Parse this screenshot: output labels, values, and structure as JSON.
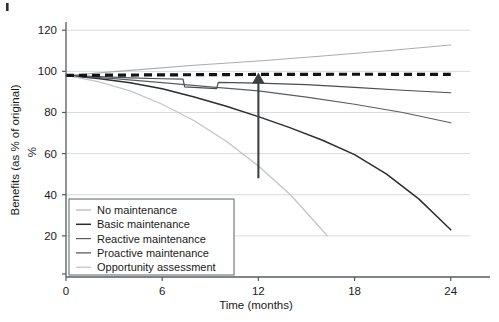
{
  "chart_data": {
    "type": "line",
    "title": "",
    "xlabel": "Time (months)",
    "ylabel": "Benefits (as % of original)",
    "ylabel_unit": "%",
    "xlim": [
      0,
      25.2
    ],
    "ylim": [
      0,
      124
    ],
    "x_ticks": [
      0,
      6,
      12,
      18,
      24
    ],
    "x_tick_labels": [
      "0",
      "6",
      "12",
      "18",
      "24"
    ],
    "y_ticks": [
      20,
      40,
      60,
      80,
      100,
      120
    ],
    "y_tick_labels": [
      "20",
      "40",
      "60",
      "80",
      "100",
      "120"
    ],
    "grid": "horizontal",
    "legend_position": "lower-left-inside",
    "series": [
      {
        "name": "No maintenance",
        "style": "solid",
        "color": "#a9acb0",
        "width": 1.1,
        "points": [
          [
            0,
            98
          ],
          [
            4,
            100.5
          ],
          [
            8,
            103
          ],
          [
            12,
            105
          ],
          [
            16,
            107.5
          ],
          [
            20,
            110
          ],
          [
            24,
            112.8
          ]
        ]
      },
      {
        "name": "Basic maintenance",
        "style": "solid",
        "color": "#2b2e30",
        "width": 1.5,
        "points": [
          [
            0,
            98
          ],
          [
            2,
            96.5
          ],
          [
            4,
            94.5
          ],
          [
            6,
            91.5
          ],
          [
            8,
            87.5
          ],
          [
            10,
            83
          ],
          [
            12,
            78
          ],
          [
            14,
            72.5
          ],
          [
            16,
            66.5
          ],
          [
            18,
            59.5
          ],
          [
            20,
            50
          ],
          [
            22,
            38
          ],
          [
            24,
            23
          ]
        ]
      },
      {
        "name": "Reactive maintenance",
        "style": "solid",
        "color": "#5a5e61",
        "width": 1.2,
        "points": [
          [
            0,
            98
          ],
          [
            3,
            96.5
          ],
          [
            6,
            94.5
          ],
          [
            9,
            92.5
          ],
          [
            12,
            90.5
          ],
          [
            15,
            87.5
          ],
          [
            18,
            84
          ],
          [
            21,
            80
          ],
          [
            24,
            75
          ]
        ]
      },
      {
        "name": "Proactive maintenance",
        "style": "solid-step",
        "color": "#4a4e51",
        "width": 1.2,
        "points": [
          [
            0,
            98
          ],
          [
            2,
            97.5
          ],
          [
            4,
            96.8
          ],
          [
            6,
            96.4
          ],
          [
            7.3,
            96.2
          ],
          [
            7.4,
            92.5
          ],
          [
            9.4,
            91.6
          ],
          [
            9.5,
            94.6
          ],
          [
            12,
            94.3
          ],
          [
            15,
            93.5
          ],
          [
            18,
            92.2
          ],
          [
            21,
            90.8
          ],
          [
            24,
            89.6
          ]
        ]
      },
      {
        "name": "Opportunity assessment",
        "style": "solid",
        "color": "#c2c5c8",
        "width": 1.3,
        "points": [
          [
            0,
            98
          ],
          [
            2,
            95
          ],
          [
            4,
            90.5
          ],
          [
            6,
            84
          ],
          [
            8,
            76
          ],
          [
            10,
            66
          ],
          [
            12,
            54
          ],
          [
            14,
            40
          ],
          [
            15.5,
            27
          ],
          [
            16.3,
            20
          ]
        ]
      }
    ],
    "reference_line": {
      "name": "target-benefit-level",
      "style": "dashed",
      "color": "#111315",
      "width": 3.2,
      "dash": "8 5",
      "points": [
        [
          0,
          98
        ],
        [
          6,
          98.3
        ],
        [
          12,
          98.5
        ],
        [
          18,
          98.6
        ],
        [
          24,
          98.5
        ]
      ]
    },
    "annotation_arrow": {
      "name": "benefit-gap-arrow",
      "direction": "up",
      "x": 12,
      "y_start": 48,
      "y_end": 98.5,
      "color": "#3d4043"
    }
  },
  "legend": {
    "entries": [
      {
        "label": "No maintenance"
      },
      {
        "label": "Basic maintenance"
      },
      {
        "label": "Reactive maintenance"
      },
      {
        "label": "Proactive maintenance"
      },
      {
        "label": "Opportunity assessment"
      }
    ]
  }
}
